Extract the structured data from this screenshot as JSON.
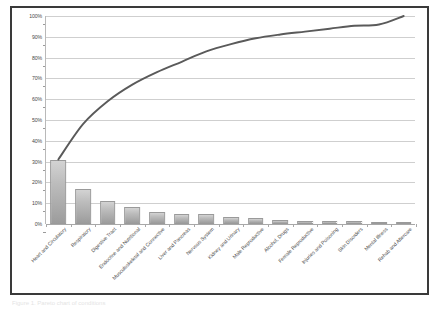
{
  "figure": {
    "caption": "Figure 1. Pareto chart of conditions",
    "frame_color": "#3a3a3a",
    "background": "#ffffff"
  },
  "chart_data": {
    "type": "bar",
    "title": "",
    "subtitle": "",
    "xlabel": "",
    "ylabel": "",
    "ylim": [
      0,
      100
    ],
    "grid": true,
    "legend": "none",
    "y_tick_labels": [
      "100%",
      "90%",
      "80%",
      "70%",
      "60%",
      "50%",
      "40%",
      "30%",
      "20%",
      "10%",
      "0%"
    ],
    "y_tick_values": [
      100,
      90,
      80,
      70,
      60,
      50,
      40,
      30,
      20,
      10,
      0
    ],
    "categories": [
      "Heart and Circulatory",
      "Respiratory",
      "Digestive Tract",
      "Endocrine and Nutritional",
      "Musculoskeletal and Connective",
      "Liver and Pancreas",
      "Nervous System",
      "Kidney and Urinary",
      "Male Reproductive",
      "Alcohol, Drugs",
      "Female Reproductive",
      "Injuries and Poisoning",
      "Skin Disorders",
      "Mental Illness",
      "Rehab and Aftercare"
    ],
    "series": [
      {
        "name": "Share",
        "type": "bar",
        "color": "#b5b5b5",
        "values": [
          31.0,
          17.0,
          11.0,
          8.0,
          6.0,
          5.0,
          5.0,
          3.5,
          2.8,
          1.8,
          1.4,
          1.4,
          1.4,
          0.6,
          0.5
        ]
      },
      {
        "name": "Cumulative",
        "type": "line",
        "color": "#5a5a5a",
        "values": [
          31.0,
          48.0,
          59.0,
          67.0,
          73.0,
          78.0,
          83.0,
          86.5,
          89.3,
          91.1,
          92.5,
          93.9,
          95.3,
          95.9,
          100.0
        ]
      }
    ]
  }
}
